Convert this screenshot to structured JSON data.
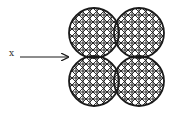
{
  "diagram": {
    "label": "x",
    "arrow": {
      "x1": 20,
      "y1": 57,
      "x2": 68,
      "y2": 57
    },
    "shape": {
      "type": "quatrefoil-of-circles",
      "radius": 25,
      "centers": [
        [
          94,
          33
        ],
        [
          139,
          33
        ],
        [
          94,
          81
        ],
        [
          139,
          81
        ]
      ],
      "grid_spacing": 7,
      "bounds": {
        "x0": 69,
        "y0": 8,
        "x1": 164,
        "y1": 106
      }
    },
    "colors": {
      "stroke": "#1a1a1a",
      "background": "#ffffff"
    }
  }
}
